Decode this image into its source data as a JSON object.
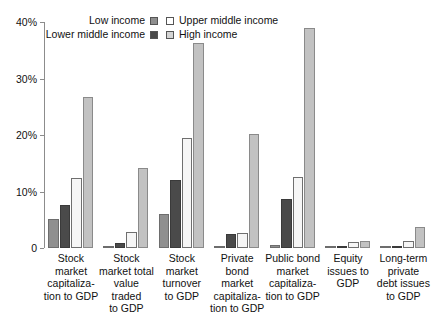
{
  "chart_data": {
    "type": "bar",
    "title": "",
    "subtitle": "",
    "xlabel": "",
    "ylabel": "",
    "ylim": [
      0,
      40
    ],
    "ytick_labels": [
      "0",
      "10%",
      "20%",
      "30%",
      "40%"
    ],
    "ytick_values": [
      0,
      10,
      20,
      30,
      40
    ],
    "grid": false,
    "legend_position": "top-center",
    "categories": [
      "Stock market capitalization to GDP",
      "Stock market total value traded to GDP",
      "Stock market turnover to GDP",
      "Private bond market capitalization to GDP",
      "Public bond market capitalization to GDP",
      "Equity issues to GDP",
      "Long-term private debt issues to GDP"
    ],
    "category_lines": [
      [
        "Stock",
        "market",
        "capitaliza-",
        "tion to GDP"
      ],
      [
        "Stock",
        "market total",
        "value traded",
        "to GDP"
      ],
      [
        "Stock",
        "market",
        "turnover",
        "to GDP"
      ],
      [
        "Private bond",
        "market",
        "capitaliza-",
        "tion to GDP"
      ],
      [
        "Public bond",
        "market",
        "capitaliza-",
        "tion to GDP"
      ],
      [
        "Equity",
        "issues to",
        "GDP"
      ],
      [
        "Long-term",
        "private",
        "debt issues",
        "to GDP"
      ]
    ],
    "series": [
      {
        "name": "Low income",
        "color": "#8f8f8f",
        "values": [
          5.2,
          0.3,
          6.0,
          0.4,
          0.5,
          0.2,
          0.2
        ]
      },
      {
        "name": "Lower middle income",
        "color": "#4a4a4a",
        "values": [
          7.6,
          0.9,
          12.0,
          2.5,
          8.7,
          0.4,
          0.4
        ]
      },
      {
        "name": "Upper middle income",
        "color": "#f6f6f6",
        "values": [
          12.4,
          2.9,
          19.4,
          2.6,
          12.5,
          1.1,
          1.2
        ]
      },
      {
        "name": "High income",
        "color": "#c2c2c2",
        "values": [
          26.7,
          14.1,
          36.2,
          20.1,
          38.9,
          1.3,
          3.8
        ]
      }
    ]
  },
  "legend": {
    "entries": [
      {
        "label": "Low income",
        "swatch": "#8f8f8f",
        "position": "left-row1"
      },
      {
        "label": "Upper middle income",
        "swatch": "#ffffff",
        "position": "right-row1"
      },
      {
        "label": "Lower middle income",
        "swatch": "#4a4a4a",
        "position": "left-row2"
      },
      {
        "label": "High income",
        "swatch": "#d4d4d4",
        "position": "right-row2"
      }
    ]
  }
}
